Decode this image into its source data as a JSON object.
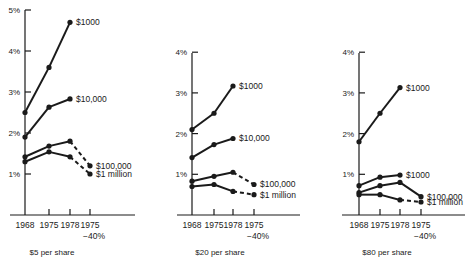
{
  "chart_data": [
    {
      "type": "line",
      "title": "$5 per share",
      "xlabel": "",
      "ylabel": "",
      "categories": [
        "1968",
        "1975",
        "1978",
        "1975 −40%"
      ],
      "ylim": [
        0,
        5
      ],
      "yticks": [
        "1%",
        "2%",
        "3%",
        "4%",
        "5%"
      ],
      "grid": false,
      "legend_position": "inline-right",
      "series": [
        {
          "name": "$1000",
          "values": [
            2.5,
            3.6,
            4.7,
            null
          ],
          "dashed_last_segment": false
        },
        {
          "name": "$10,000",
          "values": [
            1.9,
            2.63,
            2.83,
            null
          ],
          "dashed_last_segment": false
        },
        {
          "name": "$100,000",
          "values": [
            1.42,
            1.68,
            1.8,
            1.2
          ],
          "dashed_last_segment": true
        },
        {
          "name": "$1 million",
          "values": [
            1.3,
            1.54,
            1.42,
            1.0
          ],
          "dashed_last_segment": true
        }
      ]
    },
    {
      "type": "line",
      "title": "$20 per share",
      "xlabel": "",
      "ylabel": "",
      "categories": [
        "1968",
        "1975",
        "1978",
        "1975 −40%"
      ],
      "ylim": [
        0,
        4
      ],
      "yticks": [
        "1%",
        "2%",
        "3%",
        "4%"
      ],
      "grid": false,
      "legend_position": "inline-right",
      "series": [
        {
          "name": "$1000",
          "values": [
            2.1,
            2.5,
            3.17,
            null
          ],
          "dashed_last_segment": false
        },
        {
          "name": "$10,000",
          "values": [
            1.41,
            1.73,
            1.88,
            null
          ],
          "dashed_last_segment": false
        },
        {
          "name": "$100,000",
          "values": [
            0.83,
            0.95,
            1.05,
            0.75
          ],
          "dashed_last_segment": true
        },
        {
          "name": "$1 million",
          "values": [
            0.7,
            0.75,
            0.58,
            0.5
          ],
          "dashed_last_segment": true
        }
      ]
    },
    {
      "type": "line",
      "title": "$80 per share",
      "xlabel": "",
      "ylabel": "",
      "categories": [
        "1968",
        "1975",
        "1978",
        "1975 −40%"
      ],
      "ylim": [
        0,
        4
      ],
      "yticks": [
        "1%",
        "2%",
        "3%",
        "4%"
      ],
      "grid": false,
      "legend_position": "inline-right",
      "series": [
        {
          "name": "$1000",
          "values": [
            1.8,
            2.5,
            3.13,
            null
          ],
          "dashed_last_segment": false
        },
        {
          "name": "$1000",
          "values": [
            0.72,
            0.93,
            0.98,
            null
          ],
          "dashed_last_segment": false
        },
        {
          "name": "$100,000",
          "values": [
            0.55,
            0.72,
            0.8,
            0.45
          ],
          "dashed_last_segment": false
        },
        {
          "name": "$1 million",
          "values": [
            0.5,
            0.5,
            0.37,
            0.32
          ],
          "dashed_last_segment": true
        }
      ]
    }
  ],
  "layout": [
    {
      "axis_x": 25,
      "baseline_y": 215,
      "top_y": 10,
      "px_per_unit": 41,
      "x_positions": [
        25,
        49,
        70,
        90
      ],
      "axis_end_x": 135,
      "axis_start_x": 10,
      "caption_x": 52,
      "label_offsets": [
        0,
        0,
        6,
        0
      ]
    },
    {
      "axis_x": 192,
      "baseline_y": 215,
      "top_y": 53,
      "px_per_unit": 40.7,
      "x_positions": [
        192,
        214,
        233,
        254
      ],
      "axis_end_x": 300,
      "axis_start_x": 177,
      "caption_x": 220,
      "label_offsets": [
        0,
        0,
        6,
        0
      ]
    },
    {
      "axis_x": 359,
      "baseline_y": 215,
      "top_y": 53,
      "px_per_unit": 40.7,
      "x_positions": [
        359,
        380,
        400,
        421
      ],
      "axis_end_x": 465,
      "axis_start_x": 342,
      "caption_x": 387,
      "label_offsets": [
        0,
        0,
        6,
        0
      ]
    }
  ]
}
